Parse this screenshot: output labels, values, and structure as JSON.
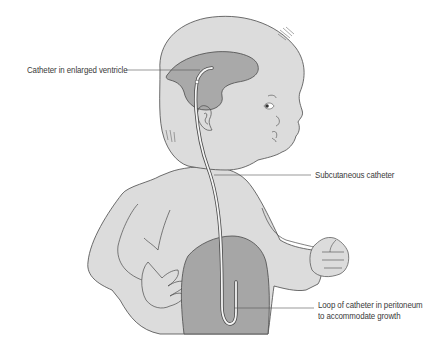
{
  "figure": {
    "labels": {
      "ventricle": "Catheter in enlarged ventricle",
      "subcutaneous": "Subcutaneous catheter",
      "loop_line1": "Loop of catheter in peritoneum",
      "loop_line2": "to accommodate growth"
    }
  },
  "colors": {
    "skin": "#dcdcdc",
    "ventricle": "#a9a9a9",
    "peritoneum": "#a6a6a6",
    "outline": "#4a4a4a",
    "catheter": "#f4f4f4",
    "leader": "#555555",
    "background": "#ffffff"
  }
}
